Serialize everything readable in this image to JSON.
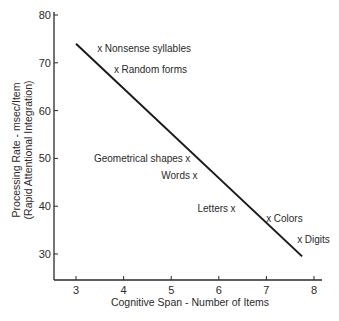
{
  "chart_data": {
    "type": "scatter",
    "title": "",
    "xlabel": "Cognitive Span - Number of Items",
    "ylabel_line1": "Processing Rate - msec/Item",
    "ylabel_line2": "(Rapid Attentional Integration)",
    "xlim": [
      2.5,
      8.2
    ],
    "ylim": [
      25,
      80
    ],
    "x_ticks": [
      3,
      4,
      5,
      6,
      7,
      8
    ],
    "y_ticks": [
      30,
      40,
      50,
      60,
      70,
      80
    ],
    "grid": false,
    "legend": null,
    "marker": "x",
    "points": [
      {
        "label": "Nonsense syllables",
        "x": 3.5,
        "y": 73,
        "label_side": "right"
      },
      {
        "label": "Random forms",
        "x": 3.85,
        "y": 68.5,
        "label_side": "right"
      },
      {
        "label": "Geometrical shapes",
        "x": 5.35,
        "y": 50,
        "label_side": "left"
      },
      {
        "label": "Words",
        "x": 5.5,
        "y": 46.5,
        "label_side": "left"
      },
      {
        "label": "Letters",
        "x": 6.3,
        "y": 39.5,
        "label_side": "left"
      },
      {
        "label": "Colors",
        "x": 7.05,
        "y": 37.5,
        "label_side": "right"
      },
      {
        "label": "Digits",
        "x": 7.7,
        "y": 33,
        "label_side": "right"
      }
    ],
    "fit_line": {
      "x": [
        3.0,
        7.75
      ],
      "y": [
        74,
        29.5
      ]
    }
  }
}
